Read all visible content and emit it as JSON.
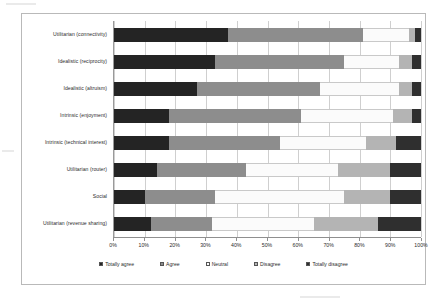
{
  "chart_data": {
    "type": "bar",
    "orientation": "horizontal",
    "stacked": true,
    "stack_mode": "percent",
    "title": "",
    "subtitle": "",
    "xlabel": "",
    "ylabel": "",
    "xlim": [
      0,
      100
    ],
    "xticks": [
      "0%",
      "10%",
      "20%",
      "30%",
      "40%",
      "50%",
      "60%",
      "70%",
      "80%",
      "90%",
      "100%"
    ],
    "xtick_values": [
      0,
      10,
      20,
      30,
      40,
      50,
      60,
      70,
      80,
      90,
      100
    ],
    "grid": true,
    "grid_axis": "x",
    "legend_position": "bottom",
    "categories": [
      "Utilitarian (connectivity)",
      "Idealistic (reciprocity)",
      "Idealistic (altruism)",
      "Intrinsic (enjoyment)",
      "Intrinsic (technical interest)",
      "Utilitarian (router)",
      "Social",
      "Utilitarian (revenue sharing)"
    ],
    "series": [
      {
        "name": "Totally agree",
        "color": "#242424",
        "values": [
          37,
          33,
          27,
          18,
          18,
          14,
          10,
          12
        ]
      },
      {
        "name": "Agree",
        "color": "#8d8d8d",
        "values": [
          44,
          42,
          40,
          43,
          36,
          29,
          23,
          20
        ]
      },
      {
        "name": "Neutral",
        "color": "#fbfbfb",
        "values": [
          15,
          18,
          26,
          30,
          28,
          30,
          42,
          33
        ]
      },
      {
        "name": "Disagree",
        "color": "#b4b4b4",
        "values": [
          2,
          4,
          4,
          6,
          10,
          17,
          15,
          21
        ]
      },
      {
        "name": "Totally disagree",
        "color": "#2f2f2f",
        "values": [
          2,
          3,
          3,
          3,
          8,
          10,
          10,
          14
        ]
      }
    ]
  },
  "legend": {
    "items": [
      {
        "label": "Totally agree",
        "swatch": "#242424"
      },
      {
        "label": "Agree",
        "swatch": "#8d8d8d"
      },
      {
        "label": "Neutral",
        "swatch": "#fbfbfb"
      },
      {
        "label": "Disagree",
        "swatch": "#b4b4b4"
      },
      {
        "label": "Totally disagree",
        "swatch": "#2f2f2f"
      }
    ]
  }
}
